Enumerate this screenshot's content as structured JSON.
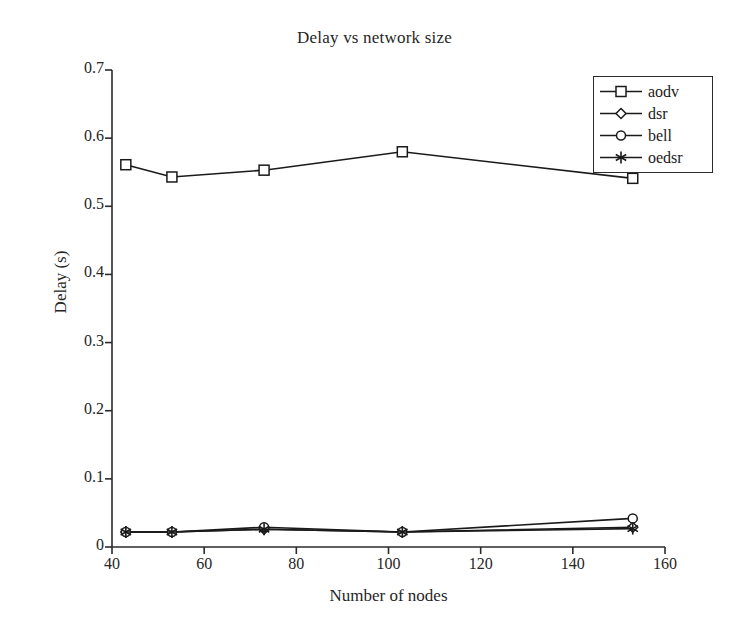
{
  "chart_data": {
    "type": "line",
    "title": "Delay vs network size",
    "xlabel": "Number of nodes",
    "ylabel": "Delay (s)",
    "x": [
      43,
      53,
      73,
      103,
      153
    ],
    "xlim": [
      40,
      160
    ],
    "ylim": [
      0,
      0.7
    ],
    "xticks": [
      40,
      60,
      80,
      100,
      120,
      140,
      160
    ],
    "xtick_labels": [
      "40",
      "60",
      "80",
      "100",
      "120",
      "140",
      "160"
    ],
    "yticks": [
      0,
      0.1,
      0.2,
      0.3,
      0.4,
      0.5,
      0.6,
      0.7
    ],
    "ytick_labels": [
      "0",
      "0.1",
      "0.2",
      "0.3",
      "0.4",
      "0.5",
      "0.6",
      "0.7"
    ],
    "grid": false,
    "legend_position": "top-right",
    "series": [
      {
        "name": "aodv",
        "marker": "square",
        "color": "#1a1a1a",
        "values": [
          0.561,
          0.543,
          0.553,
          0.58,
          0.541
        ]
      },
      {
        "name": "dsr",
        "marker": "diamond",
        "color": "#1a1a1a",
        "values": [
          0.022,
          0.022,
          0.026,
          0.022,
          0.029
        ]
      },
      {
        "name": "bell",
        "marker": "circle",
        "color": "#1a1a1a",
        "values": [
          0.022,
          0.022,
          0.029,
          0.022,
          0.042
        ]
      },
      {
        "name": "oedsr",
        "marker": "asterisk",
        "color": "#1a1a1a",
        "values": [
          0.022,
          0.022,
          0.026,
          0.022,
          0.027
        ]
      }
    ]
  },
  "figure": {
    "background": "#ffffff",
    "axis_color": "#2b2b2b",
    "text_color": "#262626"
  }
}
